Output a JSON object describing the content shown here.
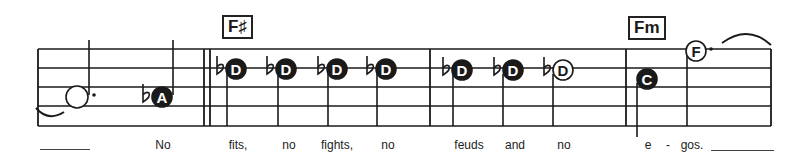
{
  "score": {
    "staff": {
      "left": 38,
      "right": 771,
      "lines_y": [
        49,
        68,
        87,
        106,
        126
      ]
    },
    "barlines_x": [
      38,
      204,
      210,
      430,
      626,
      771
    ],
    "chords": [
      {
        "label": "F♯",
        "x": 222,
        "y": 15
      },
      {
        "label": "Fm",
        "x": 628,
        "y": 16
      }
    ],
    "notes": [
      {
        "letter": "",
        "x": 77,
        "y": 97,
        "filled": false,
        "flat": false,
        "dotted": true,
        "stem_x": 89,
        "stem_dir": "up"
      },
      {
        "letter": "A",
        "x": 162,
        "y": 97,
        "filled": true,
        "flat": true,
        "dotted": false,
        "stem_x": 173,
        "stem_dir": "up"
      },
      {
        "letter": "D",
        "x": 236,
        "y": 69,
        "filled": true,
        "flat": true,
        "dotted": false,
        "stem_x": 227,
        "stem_dir": "down"
      },
      {
        "letter": "D",
        "x": 286,
        "y": 69,
        "filled": true,
        "flat": true,
        "dotted": false,
        "stem_x": 278,
        "stem_dir": "down"
      },
      {
        "letter": "D",
        "x": 337,
        "y": 69,
        "filled": true,
        "flat": true,
        "dotted": false,
        "stem_x": 328,
        "stem_dir": "down"
      },
      {
        "letter": "D",
        "x": 386,
        "y": 69,
        "filled": true,
        "flat": true,
        "dotted": false,
        "stem_x": 377,
        "stem_dir": "down"
      },
      {
        "letter": "D",
        "x": 462,
        "y": 70,
        "filled": true,
        "flat": true,
        "dotted": false,
        "stem_x": 453,
        "stem_dir": "down"
      },
      {
        "letter": "D",
        "x": 513,
        "y": 70,
        "filled": true,
        "flat": true,
        "dotted": false,
        "stem_x": 503,
        "stem_dir": "down"
      },
      {
        "letter": "D",
        "x": 563,
        "y": 70,
        "filled": false,
        "flat": true,
        "dotted": false,
        "stem_x": 553,
        "stem_dir": "down"
      },
      {
        "letter": "C",
        "x": 647,
        "y": 79,
        "filled": true,
        "flat": false,
        "dotted": false,
        "stem_x": 637,
        "stem_dir": "down"
      },
      {
        "letter": "F",
        "x": 696,
        "y": 51,
        "filled": false,
        "flat": false,
        "dotted": true,
        "stem_x": 687,
        "stem_dir": "down"
      }
    ],
    "lyrics": [
      {
        "text": "No",
        "x": 163
      },
      {
        "text": "fits,",
        "x": 238
      },
      {
        "text": "no",
        "x": 289
      },
      {
        "text": "fights,",
        "x": 337
      },
      {
        "text": "no",
        "x": 388
      },
      {
        "text": "feuds",
        "x": 469
      },
      {
        "text": "and",
        "x": 515
      },
      {
        "text": "no",
        "x": 564
      },
      {
        "text": "e",
        "x": 648
      },
      {
        "text": "-",
        "x": 668
      },
      {
        "text": "gos.",
        "x": 692
      }
    ],
    "extender_lines": [
      {
        "x": 40,
        "width": 50,
        "y": 149
      },
      {
        "x": 711,
        "width": 63,
        "y": 150
      }
    ],
    "colors": {
      "ink": "#1a1a1a",
      "paper": "#ffffff"
    }
  }
}
